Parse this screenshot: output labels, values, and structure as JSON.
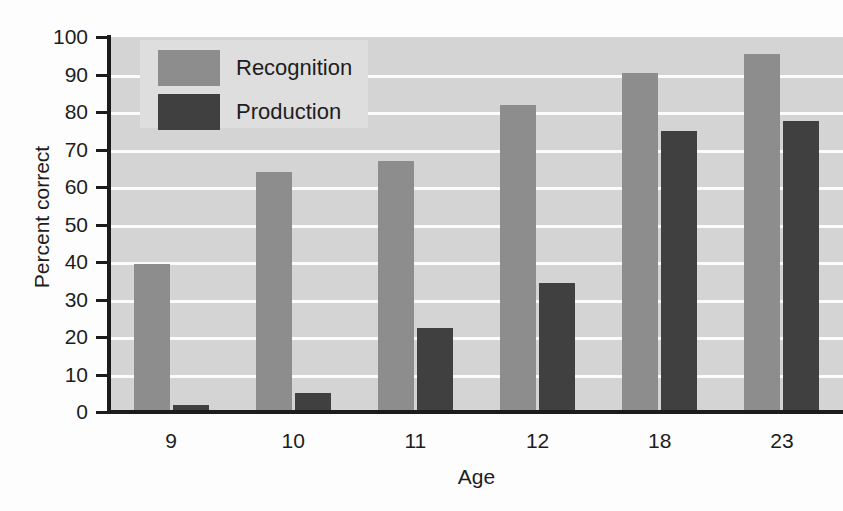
{
  "chart_data": {
    "type": "bar",
    "title": "",
    "xlabel": "Age",
    "ylabel": "Percent correct",
    "categories": [
      "9",
      "10",
      "11",
      "12",
      "18",
      "23"
    ],
    "series": [
      {
        "name": "Recognition",
        "color": "#8d8d8d",
        "values": [
          39.5,
          64,
          67,
          82,
          90.5,
          95.5
        ]
      },
      {
        "name": "Production",
        "color": "#404040",
        "values": [
          2,
          5,
          22.5,
          34.5,
          75,
          77.5
        ]
      }
    ],
    "ylim": [
      0,
      100
    ],
    "ytick_step": 10,
    "yticks": [
      "100",
      "90",
      "80",
      "70",
      "60",
      "50",
      "40",
      "30",
      "20",
      "10",
      "0"
    ],
    "grid": true,
    "grid_color": "#fbfbfb",
    "plot_background": "#d4d4d4",
    "legend_position": "upper-left"
  }
}
